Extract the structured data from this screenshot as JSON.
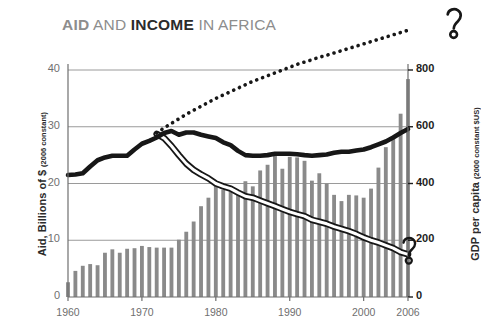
{
  "title": {
    "part_aid": "AID",
    "part_and": " AND ",
    "part_income": "INCOME",
    "part_in_africa": " IN AFRICA",
    "full": "AID AND INCOME IN AFRICA",
    "color_muted": "#8d8d8d",
    "color_emphasis": "#2b2b2b"
  },
  "axes": {
    "left_title_main": "Aid, Billions of $ ",
    "left_title_sub": "(2006 constant)",
    "right_title_main": "GDP per capita ",
    "right_title_sub": "(2000 constant $US)",
    "left_ticks": [
      "0",
      "10",
      "20",
      "30",
      "40"
    ],
    "right_ticks": [
      "0",
      "200",
      "400",
      "600",
      "800"
    ],
    "x_ticks": [
      "1960",
      "1970",
      "1980",
      "1990",
      "2000",
      "2006"
    ]
  },
  "annotations": {
    "question_mark_top": "?",
    "question_mark_bottom": "?"
  },
  "colors": {
    "bar": "#8a8a8a",
    "gridline": "#9a9a9a",
    "line_dark": "#171717",
    "line_outline_fill": "#ffffff",
    "axis": "#6f6f6f"
  },
  "chart_data": {
    "type": "bar",
    "title": "AID AND INCOME IN AFRICA",
    "xlabel": "",
    "ylabel": "Aid, Billions of $ (2006 constant)",
    "y2label": "GDP per capita (2000 constant $US)",
    "ylim": [
      0,
      44
    ],
    "y2lim": [
      0,
      880
    ],
    "xlim": [
      1960,
      2006
    ],
    "grid": true,
    "legend": "none",
    "x": [
      1960,
      1961,
      1962,
      1963,
      1964,
      1965,
      1966,
      1967,
      1968,
      1969,
      1970,
      1971,
      1972,
      1973,
      1974,
      1975,
      1976,
      1977,
      1978,
      1979,
      1980,
      1981,
      1982,
      1983,
      1984,
      1985,
      1986,
      1987,
      1988,
      1989,
      1990,
      1991,
      1992,
      1993,
      1994,
      1995,
      1996,
      1997,
      1998,
      1999,
      2000,
      2001,
      2002,
      2003,
      2004,
      2005,
      2006
    ],
    "series": [
      {
        "name": "Aid, Billions of $ (2006 constant)",
        "type": "bar",
        "axis": "left",
        "color": "#8a8a8a",
        "values": [
          2.6,
          4.6,
          5.5,
          5.8,
          5.6,
          7.8,
          8.4,
          7.8,
          8.5,
          8.6,
          9.0,
          8.8,
          8.7,
          8.7,
          8.7,
          10.1,
          11.5,
          13.3,
          16.0,
          17.5,
          19.6,
          18.9,
          18.6,
          18.8,
          20.4,
          19.5,
          22.3,
          23.3,
          24.9,
          22.6,
          24.7,
          24.6,
          24.0,
          20.5,
          21.8,
          20.0,
          18.0,
          16.9,
          18.0,
          17.9,
          17.5,
          19.1,
          22.8,
          26.4,
          28.1,
          32.3,
          38.4
        ]
      },
      {
        "name": "GDP per capita (2000 constant $US) — actual",
        "type": "line",
        "style": "thick-solid",
        "axis": "right",
        "color": "#171717",
        "values": [
          430,
          432,
          436,
          460,
          482,
          492,
          498,
          498,
          498,
          520,
          540,
          550,
          562,
          578,
          585,
          572,
          580,
          580,
          572,
          566,
          560,
          545,
          535,
          515,
          500,
          498,
          498,
          500,
          505,
          505,
          505,
          503,
          500,
          498,
          500,
          502,
          508,
          512,
          512,
          516,
          520,
          528,
          538,
          548,
          562,
          578,
          592
        ]
      },
      {
        "name": "Projected / counterfactual GDP per capita",
        "type": "line",
        "style": "dotted",
        "axis": "right",
        "color": "#171717",
        "values": [
          null,
          null,
          null,
          null,
          null,
          null,
          null,
          null,
          null,
          null,
          null,
          null,
          578,
          596,
          612,
          628,
          644,
          658,
          672,
          686,
          700,
          712,
          724,
          736,
          748,
          760,
          770,
          780,
          790,
          800,
          810,
          820,
          828,
          836,
          845,
          852,
          860,
          868,
          876,
          884,
          892,
          900,
          908,
          916,
          924,
          932,
          940
        ]
      },
      {
        "name": "Declining indicator (white-filled outline line)",
        "type": "line",
        "style": "outlined-white",
        "axis": "right",
        "color": "#171717",
        "values": [
          null,
          null,
          null,
          null,
          null,
          null,
          null,
          null,
          null,
          null,
          null,
          null,
          575,
          560,
          532,
          500,
          470,
          448,
          432,
          418,
          400,
          390,
          382,
          368,
          355,
          350,
          340,
          330,
          320,
          310,
          300,
          292,
          285,
          272,
          265,
          258,
          248,
          240,
          232,
          222,
          210,
          200,
          192,
          182,
          172,
          158,
          150
        ]
      }
    ],
    "annotations": [
      {
        "text": "?",
        "position": "top-right",
        "note": "question mark at end of dotted projection line"
      },
      {
        "text": "?",
        "position": "right-axis-near-200",
        "note": "question mark near lower-right, at end of declining line"
      }
    ]
  }
}
